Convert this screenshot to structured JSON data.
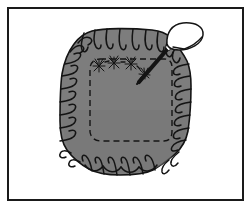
{
  "figure": {
    "alt_text": "Line drawing of a gray gathered octagonal cushion with a dashed stitching line and a threaded needle at the upper right"
  },
  "frame": {
    "label": "illustration-frame",
    "x": 7,
    "y": 7,
    "width": 237,
    "height": 194,
    "stroke_color": "#1a1a1a",
    "stroke_width": 2,
    "fill_color": "#ffffff"
  },
  "canvas": {
    "width": 251,
    "height": 213,
    "background_color": "#ffffff"
  },
  "colors": {
    "fabric_fill": "#7d7d7d",
    "fabric_fill_shadow": "#6f6f6f",
    "ink": "#141414",
    "thread_fill": "#ffffff",
    "paper": "#ffffff"
  },
  "parts": {
    "cushion_body": {
      "label": "Ruffled octagonal cushion body",
      "name": "cushion-body",
      "fill": "#7d7d7d",
      "outline": "#141414"
    },
    "seam_line": {
      "label": "Dashed stitching seam line",
      "name": "dashed-seam-line",
      "style": "dashed",
      "dash_pattern": "6 4",
      "stroke": "#141414"
    },
    "ruffle_edge": {
      "label": "Gathered ruffle edge",
      "name": "ruffle-edge",
      "gather_marks": 34
    },
    "needle": {
      "label": "Sewing needle",
      "name": "sewing-needle",
      "angle_degrees": 48,
      "tip_x": 139,
      "tip_y": 82,
      "eye_x": 172,
      "eye_y": 43
    },
    "thread_loop": {
      "label": "Thread loop through needle eye",
      "name": "thread-loop",
      "fill": "#ffffff",
      "stroke": "#141414"
    },
    "stitch_marks": {
      "label": "Hand stitch marks along seam",
      "name": "stitch-marks",
      "count": 4
    }
  },
  "legend": {
    "items": []
  }
}
